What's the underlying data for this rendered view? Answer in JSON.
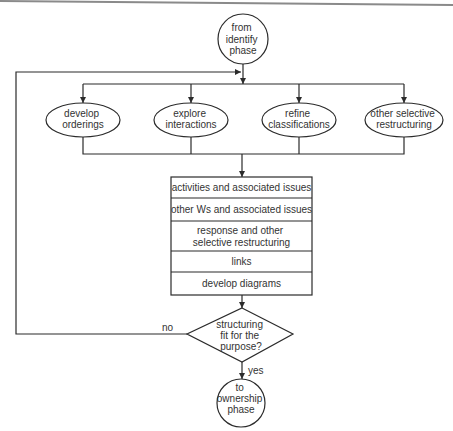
{
  "diagram": {
    "start": {
      "lines": [
        "from",
        "identify",
        "phase"
      ]
    },
    "activities": [
      {
        "lines": [
          "develop",
          "orderings"
        ]
      },
      {
        "lines": [
          "explore",
          "interactions"
        ]
      },
      {
        "lines": [
          "refine",
          "classifications"
        ]
      },
      {
        "lines": [
          "other selective",
          "restructuring"
        ]
      }
    ],
    "checklist": [
      {
        "lines": [
          "activities and associated issues"
        ]
      },
      {
        "lines": [
          "other Ws and associated issues"
        ]
      },
      {
        "lines": [
          "response and other",
          "selective restructuring"
        ]
      },
      {
        "lines": [
          "links"
        ]
      },
      {
        "lines": [
          "develop diagrams"
        ]
      }
    ],
    "decision": {
      "lines": [
        "structuring",
        "fit for the",
        "purpose?"
      ]
    },
    "edge_labels": {
      "no": "no",
      "yes": "yes"
    },
    "end": {
      "lines": [
        "to",
        "ownership",
        "phase"
      ]
    }
  },
  "colors": {
    "stroke": "#2b2b2b",
    "text": "#333333",
    "background": "#ffffff",
    "top_edge": "#8a8a8a"
  }
}
